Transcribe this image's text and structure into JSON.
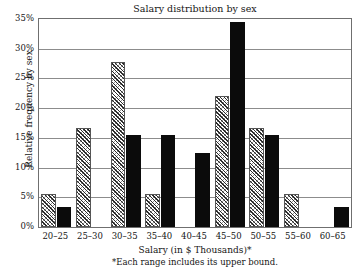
{
  "chart_data": {
    "type": "bar",
    "title": "Salary distribution by sex",
    "xlabel": "Salary (in $ Thousands)*",
    "ylabel": "Relative frequency by sex",
    "footnote": "*Each range includes its upper bound.",
    "categories": [
      "20–25",
      "25–30",
      "30–35",
      "35–40",
      "40–45",
      "45–50",
      "50–55",
      "55–60",
      "60–65"
    ],
    "series": [
      {
        "name": "hatched",
        "fill": "diagonal-hatch",
        "color": "#ffffff",
        "values": [
          5.5,
          16.7,
          27.8,
          5.5,
          0,
          22.0,
          16.7,
          5.5,
          0
        ]
      },
      {
        "name": "solid",
        "fill": "solid-black",
        "color": "#0b0b0b",
        "values": [
          3.3,
          0,
          15.5,
          15.5,
          12.4,
          34.5,
          15.5,
          0,
          3.3
        ]
      }
    ],
    "ylim": [
      0,
      35
    ],
    "ytick_step": 5,
    "ytick_labels": [
      "0%",
      "5%",
      "10%",
      "15%",
      "20%",
      "25%",
      "30%",
      "35%"
    ],
    "ytick_values": [
      0,
      5,
      10,
      15,
      20,
      25,
      30,
      35
    ],
    "grid": true,
    "legend": "none",
    "bar_order_note": "within each category the hatched bar is drawn left of the solid black bar"
  }
}
